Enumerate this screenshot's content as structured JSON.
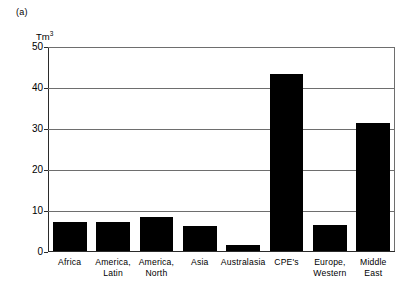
{
  "panel_label": "(a)",
  "chart_data": {
    "type": "bar",
    "title": "",
    "subtitle": "",
    "panel": "(a)",
    "xlabel": "",
    "ylabel": "Tm3",
    "ylabel_display": "Tm",
    "ylabel_superscript": "3",
    "ylim": [
      0,
      50
    ],
    "yticks": [
      0,
      10,
      20,
      30,
      40,
      50
    ],
    "ytick_labels": [
      "0",
      "10",
      "20",
      "30",
      "40",
      "50"
    ],
    "grid": true,
    "grid_axis": "y",
    "legend": false,
    "legend_position": "none",
    "bar_color": "#000000",
    "grid_color": "#6e6e6e",
    "axis_color": "#2b2b2b",
    "background": "#ffffff",
    "categories": [
      "Africa",
      "America,\nLatin",
      "America,\nNorth",
      "Asia",
      "Australasia",
      "CPE's",
      "Europe,\nWestern",
      "Middle\nEast"
    ],
    "values": [
      7.2,
      7.2,
      8.6,
      6.3,
      1.6,
      43.5,
      6.5,
      31.5
    ]
  }
}
